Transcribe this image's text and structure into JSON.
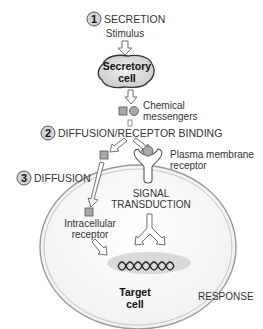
{
  "diagram": {
    "steps": [
      {
        "number": "1",
        "label": "SECRETION"
      },
      {
        "number": "2",
        "label": "DIFFUSION/RECEPTOR BINDING"
      },
      {
        "number": "3",
        "label": "DIFFUSION"
      }
    ],
    "stimulus": "Stimulus",
    "secretory_cell": {
      "line1": "Secretory",
      "line2": "cell"
    },
    "chemical_messengers": {
      "line1": "Chemical",
      "line2": "messengers"
    },
    "plasma_membrane_receptor": {
      "line1": "Plasma membrane",
      "line2": "receptor"
    },
    "signal_transduction": {
      "line1": "SIGNAL",
      "line2": "TRANSDUCTION"
    },
    "intracellular_receptor": {
      "line1": "Intracellular",
      "line2": "receptor"
    },
    "target_cell": {
      "line1": "Target",
      "line2": "cell"
    },
    "response": "RESPONSE",
    "colors": {
      "cell_fill": "#e6e6e6",
      "outline": "#6f6f6f",
      "messenger_fill": "#a8a8a8",
      "text": "#333333"
    }
  }
}
